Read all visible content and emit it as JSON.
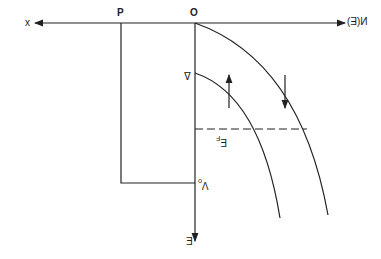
{
  "diagram": {
    "labels": {
      "x_axis": "x",
      "p_point": "P",
      "origin": "O",
      "n_axis": "N(E)",
      "e_axis": "E",
      "delta": "Δ",
      "fermi": "E_F",
      "fermi_main": "E",
      "fermi_sub": "F",
      "v0_main": "V",
      "v0_sub": "o"
    },
    "colors": {
      "line": "#222222",
      "background": "#ffffff"
    }
  }
}
